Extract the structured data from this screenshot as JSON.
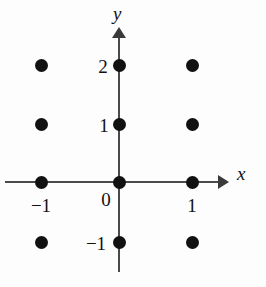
{
  "figure": {
    "type": "coordinate-plane-lattice",
    "width": 266,
    "height": 287,
    "background_color": "#fdfdfd",
    "ink_color": "#111111",
    "axis_color": "#4a4a4a"
  },
  "axes": {
    "x_name": "x",
    "y_name": "y",
    "x_axis_pixel_y": 182,
    "y_axis_pixel_x": 119,
    "x_axis_start_px": 5,
    "x_axis_arrow_tip_px": 229,
    "y_axis_arrow_tip_px": 27,
    "y_axis_end_px": 272
  },
  "labels": {
    "x_ticks": [
      {
        "text": "−1",
        "value": -1,
        "px_x": 41,
        "px_y": 196
      },
      {
        "text": "0",
        "value": 0,
        "px_x": 106,
        "px_y": 190
      },
      {
        "text": "1",
        "value": 1,
        "px_x": 192,
        "px_y": 196
      }
    ],
    "y_ticks": [
      {
        "text": "2",
        "value": 2,
        "px_x": 103,
        "px_y": 57
      },
      {
        "text": "1",
        "value": 1,
        "px_x": 104,
        "px_y": 116
      },
      {
        "text": "−1",
        "value": -1,
        "px_x": 96,
        "px_y": 234
      }
    ]
  },
  "chart_data": {
    "type": "scatter",
    "title": "",
    "xlabel": "x",
    "ylabel": "y",
    "xlim": [
      -1.6,
      1.5
    ],
    "ylim": [
      -1.5,
      2.4
    ],
    "grid": false,
    "legend": null,
    "marker": "filled-circle",
    "marker_color": "#111111",
    "marker_radius_px": 6.5,
    "xticks": [
      -1,
      0,
      1
    ],
    "xticklabels": [
      "−1",
      "0",
      "1"
    ],
    "yticks": [
      -1,
      1,
      2
    ],
    "yticklabels": [
      "−1",
      "1",
      "2"
    ],
    "x": [
      -1,
      0,
      1,
      -1,
      0,
      1,
      -1,
      0,
      1,
      -1,
      0,
      1
    ],
    "y": [
      2,
      2,
      2,
      1,
      1,
      1,
      0,
      0,
      0,
      -1,
      -1,
      -1
    ],
    "points": [
      {
        "x": -1,
        "y": 2,
        "px_x": 41,
        "px_y": 65
      },
      {
        "x": 0,
        "y": 2,
        "px_x": 119,
        "px_y": 65
      },
      {
        "x": 1,
        "y": 2,
        "px_x": 192,
        "px_y": 65
      },
      {
        "x": -1,
        "y": 1,
        "px_x": 41,
        "px_y": 124
      },
      {
        "x": 0,
        "y": 1,
        "px_x": 119,
        "px_y": 124
      },
      {
        "x": 1,
        "y": 1,
        "px_x": 192,
        "px_y": 124
      },
      {
        "x": -1,
        "y": 0,
        "px_x": 41,
        "px_y": 182
      },
      {
        "x": 0,
        "y": 0,
        "px_x": 119,
        "px_y": 182
      },
      {
        "x": 1,
        "y": 0,
        "px_x": 192,
        "px_y": 182
      },
      {
        "x": -1,
        "y": -1,
        "px_x": 41,
        "px_y": 242
      },
      {
        "x": 0,
        "y": -1,
        "px_x": 119,
        "px_y": 242
      },
      {
        "x": 1,
        "y": -1,
        "px_x": 192,
        "px_y": 242
      }
    ]
  }
}
